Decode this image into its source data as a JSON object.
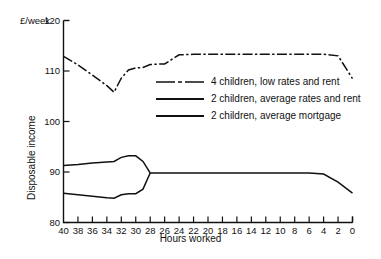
{
  "chart_data": {
    "type": "line",
    "title": "",
    "xlabel": "Hours worked",
    "ylabel": "Disposable income",
    "yunit": "£/week",
    "xlim": [
      40,
      0
    ],
    "ylim": [
      80,
      120
    ],
    "xticks": [
      40,
      38,
      36,
      34,
      32,
      30,
      28,
      26,
      24,
      22,
      20,
      18,
      16,
      14,
      12,
      10,
      8,
      6,
      4,
      2,
      0
    ],
    "yticks": [
      80,
      90,
      100,
      110,
      120
    ],
    "x_axis_reversed": true,
    "grid": false,
    "legend_position": "inside-right",
    "series": [
      {
        "name": "4 children, low rates and rent",
        "style": "dash-dot",
        "color": "#111111",
        "x": [
          40,
          38,
          36,
          34,
          33,
          32,
          31,
          30,
          29,
          28,
          26,
          24,
          22,
          20,
          18,
          16,
          14,
          12,
          10,
          8,
          6,
          4,
          2,
          0
        ],
        "y": [
          112.9,
          111.2,
          109.2,
          107.1,
          105.8,
          108.6,
          110.2,
          110.6,
          110.7,
          111.3,
          111.4,
          113.2,
          113.3,
          113.3,
          113.3,
          113.3,
          113.3,
          113.3,
          113.3,
          113.3,
          113.3,
          113.3,
          113.0,
          108.5
        ]
      },
      {
        "name": "2 children, average rates and rent",
        "style": "solid",
        "color": "#111111",
        "x": [
          40,
          38,
          36,
          34,
          33,
          32,
          31,
          30,
          29,
          28,
          26,
          24,
          22,
          20,
          18,
          16,
          14,
          12,
          10,
          8,
          6,
          4,
          2,
          0
        ],
        "y": [
          91.3,
          91.5,
          91.8,
          92.0,
          92.1,
          92.9,
          93.2,
          93.2,
          92.1,
          89.8,
          89.8,
          89.8,
          89.8,
          89.8,
          89.8,
          89.8,
          89.8,
          89.8,
          89.8,
          89.8,
          89.8,
          89.6,
          88.0,
          85.8
        ]
      },
      {
        "name": "2 children, average mortgage",
        "style": "solid",
        "color": "#111111",
        "x": [
          40,
          38,
          36,
          34,
          33,
          32,
          31,
          30,
          29,
          28
        ],
        "y": [
          85.8,
          85.5,
          85.2,
          84.9,
          84.8,
          85.5,
          85.7,
          85.7,
          86.6,
          89.8
        ]
      }
    ]
  }
}
